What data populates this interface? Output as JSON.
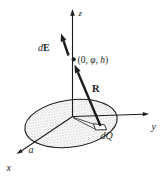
{
  "figure": {
    "background_color": "#ffffff",
    "line_color": "#1c1c1c",
    "stipple_color": "#8e8e8e"
  },
  "axes": {
    "x_label": "x",
    "y_label": "y",
    "z_label": "z"
  },
  "labels": {
    "field_point_open": "(0, ",
    "field_point_phi": "φ",
    "field_point_sep": ", ",
    "field_point_h": "h",
    "field_point_close": ")",
    "dE_d": "d",
    "dE_E": "E",
    "R": "R",
    "dQ": "dQ",
    "disk_radius": "a"
  }
}
